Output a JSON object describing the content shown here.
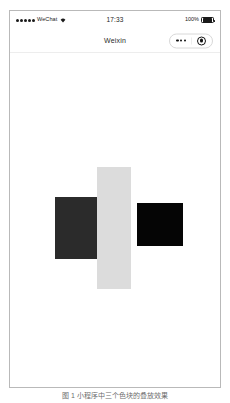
{
  "figure": {
    "caption": "图 1  小程序中三个色块的叠放效果"
  },
  "phone": {
    "status_bar": {
      "signal_dots": 5,
      "carrier": "WeChat",
      "wifi_icon": "wifi-icon",
      "time": "17:33",
      "battery_percent": "100%",
      "battery_icon": "battery-full-icon",
      "battery_level": 100
    },
    "nav_bar": {
      "title": "Weixin",
      "capsule": {
        "menu_icon": "more-dots-icon",
        "menu_label": "•••",
        "close_icon": "target-circle-icon"
      }
    },
    "canvas": {
      "background": "#ffffff",
      "blocks": [
        {
          "name": "left-dark-rect",
          "color": "#2b2b2b",
          "x": 45,
          "y": 144,
          "width": 45,
          "height": 62
        },
        {
          "name": "center-light-rect",
          "color": "#dcdcdc",
          "x": 87,
          "y": 114,
          "width": 34,
          "height": 122
        },
        {
          "name": "right-black-rect",
          "color": "#050505",
          "x": 127,
          "y": 150,
          "width": 46,
          "height": 43
        }
      ]
    }
  }
}
